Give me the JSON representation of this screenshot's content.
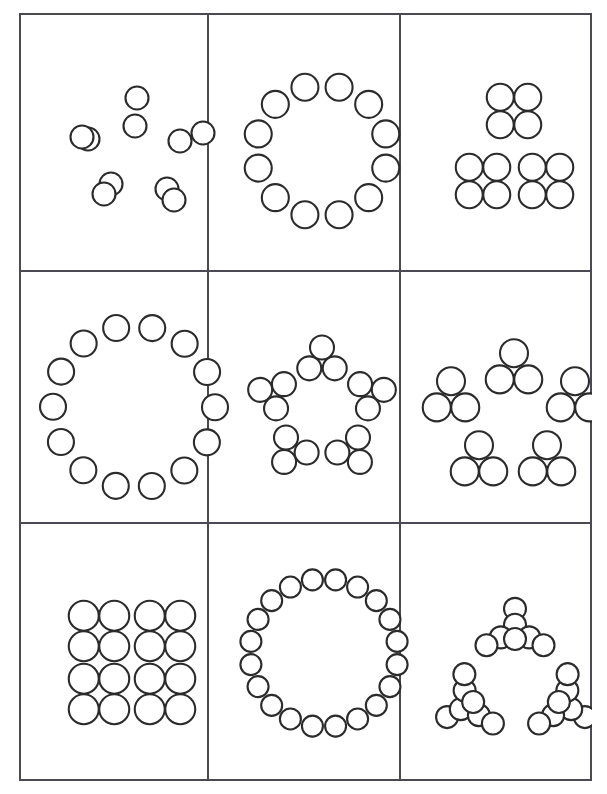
{
  "document": {
    "title": "Numerosity Dot-Pattern Grid",
    "background_color": "#ffffff",
    "border_color": "#4a4a52",
    "dot_stroke_color": "#2b2b2b",
    "dot_fill_color": "#ffffff",
    "rows": 3,
    "columns": 3,
    "panel_count": 9
  },
  "grid": {
    "left": 19,
    "top": 13,
    "width": 573,
    "height": 768,
    "column_edges": [
      0,
      189,
      381,
      573
    ],
    "row_edges": [
      0,
      258,
      510,
      768
    ]
  },
  "panels": [
    {
      "index": 1,
      "row": 1,
      "column": 1,
      "name": "panel-star-5-pairs",
      "total_dots": 10,
      "group_count": 5,
      "dots_per_group": 2,
      "arrangement": "five pairs radiating in a star / pentagon formation",
      "dot_radius": 11.5,
      "dots": [
        [
          118,
          85
        ],
        [
          116,
          113
        ],
        [
          161,
          128
        ],
        [
          184,
          120
        ],
        [
          148,
          176
        ],
        [
          155,
          187
        ],
        [
          92,
          171
        ],
        [
          85,
          181
        ],
        [
          69,
          126
        ],
        [
          63,
          124
        ]
      ]
    },
    {
      "index": 2,
      "row": 1,
      "column": 2,
      "name": "panel-ring-12",
      "total_dots": 12,
      "group_count": 1,
      "dots_per_group": 12,
      "arrangement": "single ring of twelve dots",
      "dot_radius": 13.5,
      "ring": {
        "cx": 303,
        "cy": 138,
        "radius": 66,
        "count": 12,
        "start_angle": -75
      }
    },
    {
      "index": 3,
      "row": 1,
      "column": 3,
      "name": "panel-triads-of-four-12",
      "total_dots": 12,
      "group_count": 3,
      "dots_per_group": 4,
      "arrangement": "three 2x2 squares in a triangular layout",
      "dot_radius": 13.5,
      "clusters": [
        {
          "cx": 495,
          "cy": 98,
          "type": "square4"
        },
        {
          "cx": 464,
          "cy": 168,
          "type": "square4"
        },
        {
          "cx": 527,
          "cy": 168,
          "type": "square4"
        }
      ]
    },
    {
      "index": 4,
      "row": 2,
      "column": 1,
      "name": "panel-ring-14",
      "total_dots": 14,
      "group_count": 1,
      "dots_per_group": 14,
      "arrangement": "single large ring of fourteen dots",
      "dot_radius": 13.0,
      "ring": {
        "cx": 115,
        "cy": 394,
        "radius": 81,
        "count": 14,
        "start_angle": -77
      }
    },
    {
      "index": 5,
      "row": 2,
      "column": 2,
      "name": "panel-star-5-triads",
      "total_dots": 15,
      "group_count": 5,
      "dots_per_group": 3,
      "arrangement": "five triangular triplets in a star formation",
      "dot_radius": 12.0,
      "clusters": [
        {
          "cx": 303,
          "cy": 348,
          "rot": 0,
          "type": "triad3"
        },
        {
          "cx": 352,
          "cy": 381,
          "rot": 72,
          "type": "triad3"
        },
        {
          "cx": 333,
          "cy": 438,
          "rot": 144,
          "type": "triad3"
        },
        {
          "cx": 273,
          "cy": 438,
          "rot": 216,
          "type": "triad3"
        },
        {
          "cx": 254,
          "cy": 381,
          "rot": 288,
          "type": "triad3"
        }
      ]
    },
    {
      "index": 6,
      "row": 2,
      "column": 3,
      "name": "panel-pentagon-5-triads",
      "total_dots": 15,
      "group_count": 5,
      "dots_per_group": 3,
      "arrangement": "five upright triangular triplets at pentagon vertices",
      "dot_radius": 14.0,
      "clusters": [
        {
          "cx": 495,
          "cy": 355,
          "type": "tri3up"
        },
        {
          "cx": 432,
          "cy": 383,
          "type": "tri3up"
        },
        {
          "cx": 556,
          "cy": 383,
          "type": "tri3up"
        },
        {
          "cx": 460,
          "cy": 447,
          "type": "tri3up"
        },
        {
          "cx": 528,
          "cy": 447,
          "type": "tri3up"
        }
      ]
    },
    {
      "index": 7,
      "row": 3,
      "column": 1,
      "name": "panel-quads-16",
      "total_dots": 16,
      "group_count": 4,
      "dots_per_group": 4,
      "arrangement": "four 2x2 squares arranged in a 2x2 grid",
      "dot_radius": 15.0,
      "clusters": [
        {
          "cx": 80,
          "cy": 618,
          "type": "square4"
        },
        {
          "cx": 146,
          "cy": 618,
          "type": "square4"
        },
        {
          "cx": 80,
          "cy": 681,
          "type": "square4"
        },
        {
          "cx": 146,
          "cy": 681,
          "type": "square4"
        }
      ]
    },
    {
      "index": 8,
      "row": 3,
      "column": 2,
      "name": "panel-ring-20",
      "total_dots": 20,
      "group_count": 1,
      "dots_per_group": 20,
      "arrangement": "single ring of twenty small dots",
      "dot_radius": 10.5,
      "ring": {
        "cx": 305,
        "cy": 640,
        "radius": 74,
        "count": 20,
        "start_angle": -81
      }
    },
    {
      "index": 9,
      "row": 3,
      "column": 3,
      "name": "panel-triangle-3-sevens",
      "total_dots": 21,
      "group_count": 3,
      "dots_per_group": 7,
      "arrangement": "three seven-dot arrow clusters in a triangular layout",
      "dot_radius": 11.0,
      "clusters": [
        {
          "cx": 496,
          "cy": 620,
          "rot": 0,
          "type": "arrow7"
        },
        {
          "cx": 449,
          "cy": 692,
          "rot": 240,
          "type": "arrow7"
        },
        {
          "cx": 545,
          "cy": 692,
          "rot": 120,
          "type": "arrow7"
        }
      ]
    }
  ]
}
